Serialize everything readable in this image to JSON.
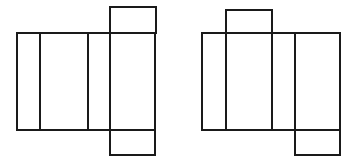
{
  "figure": {
    "background_color": "#ffffff",
    "stroke_color": "#1a1a1a",
    "stroke_width": 2,
    "canvas": {
      "width": 361,
      "height": 164
    },
    "nets": [
      {
        "id": "left-net",
        "label": "Left net",
        "band": {
          "x": 17,
          "y": 33,
          "width": 138,
          "height": 97
        },
        "band_dividers_x": [
          40,
          88,
          110
        ],
        "cells": [
          {
            "name": "cell-1",
            "x": 17,
            "y": 33,
            "width": 23,
            "height": 97
          },
          {
            "name": "cell-2",
            "x": 40,
            "y": 33,
            "width": 48,
            "height": 97
          },
          {
            "name": "cell-3",
            "x": 88,
            "y": 33,
            "width": 22,
            "height": 97
          },
          {
            "name": "cell-4",
            "x": 110,
            "y": 33,
            "width": 45,
            "height": 97
          }
        ],
        "top_flap": {
          "x": 110,
          "y": 7,
          "width": 46,
          "height": 26,
          "attached_to": "cell-4"
        },
        "bottom_flap": {
          "x": 110,
          "y": 130,
          "width": 45,
          "height": 25,
          "attached_to": "cell-4"
        }
      },
      {
        "id": "right-net",
        "label": "Right net",
        "band": {
          "x": 202,
          "y": 33,
          "width": 138,
          "height": 97
        },
        "band_dividers_x": [
          226,
          272,
          295
        ],
        "cells": [
          {
            "name": "cell-1",
            "x": 202,
            "y": 33,
            "width": 24,
            "height": 97
          },
          {
            "name": "cell-2",
            "x": 226,
            "y": 33,
            "width": 46,
            "height": 97
          },
          {
            "name": "cell-3",
            "x": 272,
            "y": 33,
            "width": 23,
            "height": 97
          },
          {
            "name": "cell-4",
            "x": 295,
            "y": 33,
            "width": 45,
            "height": 97
          }
        ],
        "top_flap": {
          "x": 226,
          "y": 10,
          "width": 46,
          "height": 23,
          "attached_to": "cell-2"
        },
        "bottom_flap": {
          "x": 295,
          "y": 130,
          "width": 45,
          "height": 25,
          "attached_to": "cell-4"
        }
      }
    ]
  }
}
